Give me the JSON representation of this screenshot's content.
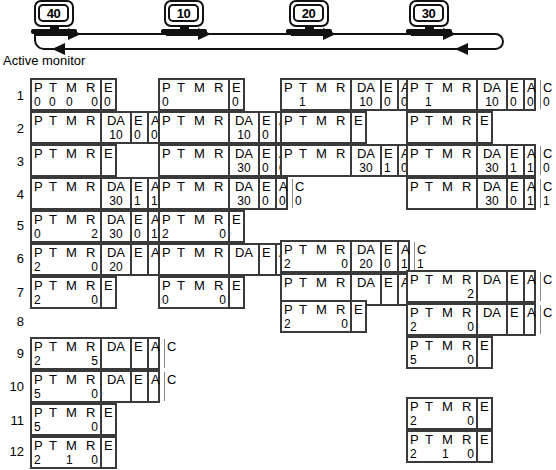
{
  "ring": {
    "stations": [
      {
        "name": "station-40",
        "label": "40",
        "x": 28
      },
      {
        "name": "station-10",
        "label": "10",
        "x": 158
      },
      {
        "name": "station-20",
        "label": "20",
        "x": 283
      },
      {
        "name": "station-30",
        "label": "30",
        "x": 403
      }
    ],
    "caption": "Active monitor",
    "arrows_right": [
      {
        "x": 68,
        "y": 28
      },
      {
        "x": 198,
        "y": 28
      },
      {
        "x": 323,
        "y": 28
      },
      {
        "x": 443,
        "y": 28
      }
    ],
    "arrows_left": [
      {
        "x": 52,
        "y": 43
      },
      {
        "x": 455,
        "y": 43
      }
    ]
  },
  "row_numbers": [
    {
      "label": "1",
      "y": 89
    },
    {
      "label": "2",
      "y": 122
    },
    {
      "label": "3",
      "y": 155
    },
    {
      "label": "4",
      "y": 188
    },
    {
      "label": "5",
      "y": 219
    },
    {
      "label": "6",
      "y": 252
    },
    {
      "label": "7",
      "y": 286
    },
    {
      "label": "8",
      "y": 315
    },
    {
      "label": "9",
      "y": 347
    },
    {
      "label": "10",
      "y": 380
    },
    {
      "label": "11",
      "y": 414
    },
    {
      "label": "12",
      "y": 445
    }
  ],
  "headers": {
    "p": "P",
    "t": "T",
    "m": "M",
    "r": "R",
    "e": "E",
    "da": "DA",
    "a": "A",
    "c": "C"
  },
  "frames": [
    {
      "name": "frame-c1-r1",
      "col": 1,
      "x": 30,
      "y": 78,
      "kind": "short",
      "p": "0",
      "t": "0",
      "m": "0",
      "r": "0",
      "e": "0"
    },
    {
      "name": "frame-c1-r2",
      "col": 1,
      "x": 30,
      "y": 111,
      "kind": "full",
      "p": "",
      "t": "",
      "m": "",
      "r": "",
      "da": "10",
      "e": "0",
      "a": "0",
      "c": "0"
    },
    {
      "name": "frame-c1-r3",
      "col": 1,
      "x": 30,
      "y": 144,
      "kind": "short",
      "p": "",
      "t": "",
      "m": "",
      "r": "",
      "e": ""
    },
    {
      "name": "frame-c1-r4",
      "col": 1,
      "x": 30,
      "y": 177,
      "kind": "full",
      "p": "",
      "t": "",
      "m": "",
      "r": "",
      "da": "30",
      "e": "1",
      "a": "1",
      "c": "0"
    },
    {
      "name": "frame-c1-r5",
      "col": 1,
      "x": 30,
      "y": 210,
      "kind": "full",
      "p": "0",
      "t": "",
      "m": "",
      "r": "2",
      "da": "30",
      "e": "0",
      "a": "1",
      "c": "1"
    },
    {
      "name": "frame-c1-r6",
      "col": 1,
      "x": 30,
      "y": 243,
      "kind": "full-narrow",
      "p": "2",
      "t": "",
      "m": "",
      "r": "0",
      "da": "20",
      "e": "",
      "a": "",
      "c": ""
    },
    {
      "name": "frame-c1-r7",
      "col": 1,
      "x": 30,
      "y": 276,
      "kind": "short",
      "p": "2",
      "t": "",
      "m": "",
      "r": "0",
      "e": ""
    },
    {
      "name": "frame-c1-r9",
      "col": 1,
      "x": 30,
      "y": 337,
      "kind": "full-empty",
      "p": "2",
      "t": "",
      "m": "",
      "r": "5",
      "da": "",
      "e": "",
      "a": "",
      "c": ""
    },
    {
      "name": "frame-c1-r10",
      "col": 1,
      "x": 30,
      "y": 370,
      "kind": "full-empty",
      "p": "5",
      "t": "",
      "m": "",
      "r": "0",
      "da": "",
      "e": "",
      "a": "",
      "c": ""
    },
    {
      "name": "frame-c1-r11",
      "col": 1,
      "x": 30,
      "y": 403,
      "kind": "short",
      "p": "5",
      "t": "",
      "m": "",
      "r": "0",
      "e": ""
    },
    {
      "name": "frame-c1-r12",
      "col": 1,
      "x": 30,
      "y": 436,
      "kind": "short",
      "p": "2",
      "t": "",
      "m": "1",
      "r": "0",
      "e": ""
    },
    {
      "name": "frame-c2-r1",
      "col": 2,
      "x": 158,
      "y": 78,
      "kind": "short",
      "p": "0",
      "t": "",
      "m": "",
      "r": "",
      "e": "0"
    },
    {
      "name": "frame-c2-r2",
      "col": 2,
      "x": 158,
      "y": 111,
      "kind": "full",
      "p": "",
      "t": "",
      "m": "",
      "r": "",
      "da": "10",
      "e": "0",
      "a": "1",
      "c": "1"
    },
    {
      "name": "frame-c2-r3",
      "col": 2,
      "x": 158,
      "y": 144,
      "kind": "full",
      "p": "",
      "t": "",
      "m": "",
      "r": "",
      "da": "30",
      "e": "0",
      "a": "0",
      "c": "0"
    },
    {
      "name": "frame-c2-r4",
      "col": 2,
      "x": 158,
      "y": 177,
      "kind": "full",
      "p": "",
      "t": "",
      "m": "",
      "r": "",
      "da": "30",
      "e": "0",
      "a": "0",
      "c": "0"
    },
    {
      "name": "frame-c2-r5",
      "col": 2,
      "x": 158,
      "y": 210,
      "kind": "short",
      "p": "2",
      "t": "",
      "m": "",
      "r": "0",
      "e": ""
    },
    {
      "name": "frame-c2-r6",
      "col": 2,
      "x": 158,
      "y": 243,
      "kind": "full-empty",
      "p": "",
      "t": "",
      "m": "",
      "r": "",
      "da": "",
      "e": "",
      "a": "",
      "c": ""
    },
    {
      "name": "frame-c2-r7",
      "col": 2,
      "x": 158,
      "y": 276,
      "kind": "short",
      "p": "0",
      "t": "",
      "m": "",
      "r": "0",
      "e": ""
    },
    {
      "name": "frame-c3-r1",
      "col": 3,
      "x": 280,
      "y": 78,
      "kind": "full",
      "p": "",
      "t": "1",
      "m": "",
      "r": "",
      "da": "10",
      "e": "0",
      "a": "0",
      "c": "0"
    },
    {
      "name": "frame-c3-r2",
      "col": 3,
      "x": 280,
      "y": 111,
      "kind": "short",
      "p": "",
      "t": "",
      "m": "",
      "r": "",
      "e": ""
    },
    {
      "name": "frame-c3-r3",
      "col": 3,
      "x": 280,
      "y": 144,
      "kind": "full",
      "p": "",
      "t": "",
      "m": "",
      "r": "",
      "da": "30",
      "e": "1",
      "a": "0",
      "c": "0"
    },
    {
      "name": "frame-c3-r6",
      "col": 3,
      "x": 280,
      "y": 240,
      "kind": "full",
      "p": "2",
      "t": "",
      "m": "",
      "r": "0",
      "da": "20",
      "e": "0",
      "a": "1",
      "c": "1"
    },
    {
      "name": "frame-c3-r7",
      "col": 3,
      "x": 280,
      "y": 273,
      "kind": "full-empty",
      "p": "",
      "t": "",
      "m": "",
      "r": "",
      "da": "",
      "e": "",
      "a": "",
      "c": ""
    },
    {
      "name": "frame-c3-r8",
      "col": 3,
      "x": 280,
      "y": 300,
      "kind": "short",
      "p": "2",
      "t": "",
      "m": "",
      "r": "0",
      "e": ""
    },
    {
      "name": "frame-c4-r1",
      "col": 4,
      "x": 406,
      "y": 78,
      "kind": "full",
      "p": "",
      "t": "1",
      "m": "",
      "r": "",
      "da": "10",
      "e": "0",
      "a": "0",
      "c": "0"
    },
    {
      "name": "frame-c4-r2",
      "col": 4,
      "x": 406,
      "y": 111,
      "kind": "short",
      "p": "",
      "t": "",
      "m": "",
      "r": "",
      "e": ""
    },
    {
      "name": "frame-c4-r3",
      "col": 4,
      "x": 406,
      "y": 144,
      "kind": "full",
      "p": "",
      "t": "",
      "m": "",
      "r": "",
      "da": "30",
      "e": "1",
      "a": "1",
      "c": "0"
    },
    {
      "name": "frame-c4-r4",
      "col": 4,
      "x": 406,
      "y": 177,
      "kind": "full",
      "p": "",
      "t": "",
      "m": "",
      "r": "",
      "da": "30",
      "e": "0",
      "a": "1",
      "c": "1"
    },
    {
      "name": "frame-c4-r7",
      "col": 4,
      "x": 406,
      "y": 270,
      "kind": "full-empty",
      "p": "",
      "t": "",
      "m": "",
      "r": "2",
      "da": "",
      "e": "",
      "a": "",
      "c": ""
    },
    {
      "name": "frame-c4-r8",
      "col": 4,
      "x": 406,
      "y": 303,
      "kind": "full-empty",
      "p": "2",
      "t": "",
      "m": "",
      "r": "0",
      "da": "",
      "e": "",
      "a": "",
      "c": ""
    },
    {
      "name": "frame-c4-r9",
      "col": 4,
      "x": 406,
      "y": 336,
      "kind": "short",
      "p": "5",
      "t": "",
      "m": "",
      "r": "0",
      "e": ""
    },
    {
      "name": "frame-c4-r11",
      "col": 4,
      "x": 406,
      "y": 397,
      "kind": "short",
      "p": "2",
      "t": "",
      "m": "",
      "r": "0",
      "e": ""
    },
    {
      "name": "frame-c4-r12",
      "col": 4,
      "x": 406,
      "y": 430,
      "kind": "short",
      "p": "2",
      "t": "",
      "m": "1",
      "r": "0",
      "e": ""
    }
  ]
}
